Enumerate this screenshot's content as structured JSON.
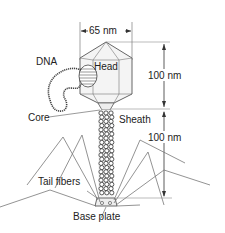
{
  "diagram": {
    "labels": {
      "width_dim": "65 nm",
      "head": "Head",
      "dna": "DNA",
      "head_height": "100 nm",
      "core": "Core",
      "sheath": "Sheath",
      "tail_height": "100 nm",
      "tail_fibers": "Tail fibers",
      "base_plate": "Base plate"
    },
    "colors": {
      "line": "#555555",
      "fill": "#f4f4f4",
      "text": "#222222",
      "fiber": "#777777"
    }
  }
}
